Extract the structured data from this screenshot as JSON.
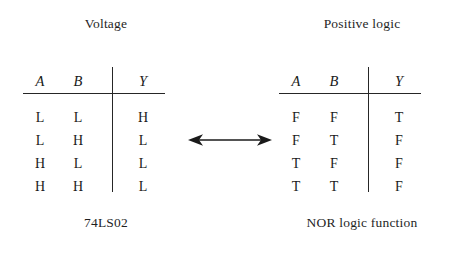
{
  "figure": {
    "left_table": {
      "caption_top": "Voltage",
      "caption_bottom": "74LS02",
      "headers": {
        "a": "A",
        "b": "B",
        "y": "Y"
      },
      "rows": [
        {
          "a": "L",
          "b": "L",
          "y": "H"
        },
        {
          "a": "L",
          "b": "H",
          "y": "L"
        },
        {
          "a": "H",
          "b": "L",
          "y": "L"
        },
        {
          "a": "H",
          "b": "H",
          "y": "L"
        }
      ]
    },
    "right_table": {
      "caption_top": "Positive logic",
      "caption_bottom": "NOR logic function",
      "headers": {
        "a": "A",
        "b": "B",
        "y": "Y"
      },
      "rows": [
        {
          "a": "F",
          "b": "F",
          "y": "T"
        },
        {
          "a": "F",
          "b": "T",
          "y": "F"
        },
        {
          "a": "T",
          "b": "F",
          "y": "F"
        },
        {
          "a": "T",
          "b": "T",
          "y": "F"
        }
      ]
    },
    "connector": {
      "icon": "double-headed-arrow-icon",
      "color": "#1a1a1a"
    },
    "colors": {
      "background": "#ffffff",
      "ink": "#1a1a1a",
      "rule": "#262626"
    }
  }
}
